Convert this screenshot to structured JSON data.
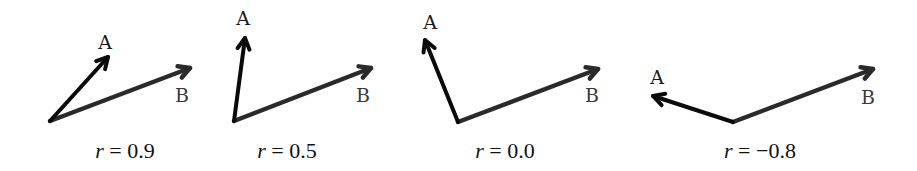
{
  "figure": {
    "colors": {
      "vector_a": "#0a0a0a",
      "vector_b": "#2a2a2a",
      "background": "#ffffff"
    },
    "panels": [
      {
        "id": "p1",
        "label_a": "A",
        "label_b": "B",
        "caption_var": "r",
        "caption_eq": " = ",
        "caption_val": "0.9",
        "origin": [
          50,
          121
        ],
        "a_tip": [
          108,
          57
        ],
        "b_tip": [
          190,
          68
        ],
        "label_a_pos": [
          105,
          42
        ],
        "label_b_pos": [
          182,
          95
        ],
        "caption_pos": [
          125,
          151
        ]
      },
      {
        "id": "p2",
        "label_a": "A",
        "label_b": "B",
        "caption_var": "r",
        "caption_eq": " = ",
        "caption_val": "0.5",
        "origin": [
          234,
          121
        ],
        "a_tip": [
          245,
          38
        ],
        "b_tip": [
          371,
          68
        ],
        "label_a_pos": [
          243,
          18
        ],
        "label_b_pos": [
          363,
          95
        ],
        "caption_pos": [
          287,
          151
        ]
      },
      {
        "id": "p3",
        "label_a": "A",
        "label_b": "B",
        "caption_var": "r",
        "caption_eq": " = ",
        "caption_val": "0.0",
        "origin": [
          458,
          122
        ],
        "a_tip": [
          425,
          40
        ],
        "b_tip": [
          598,
          69
        ],
        "label_a_pos": [
          430,
          22
        ],
        "label_b_pos": [
          592,
          95
        ],
        "caption_pos": [
          505,
          151
        ]
      },
      {
        "id": "p4",
        "label_a": "A",
        "label_b": "B",
        "caption_var": "r",
        "caption_eq": " = ",
        "caption_val": "−0.8",
        "origin": [
          733,
          122
        ],
        "a_tip": [
          653,
          96
        ],
        "b_tip": [
          873,
          69
        ],
        "label_a_pos": [
          657,
          77
        ],
        "label_b_pos": [
          868,
          97
        ],
        "caption_pos": [
          760,
          151
        ]
      }
    ]
  }
}
